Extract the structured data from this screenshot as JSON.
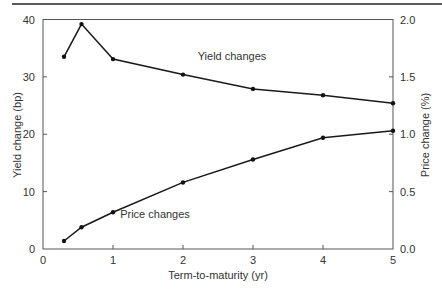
{
  "chart_data": {
    "type": "line",
    "title": "",
    "xlabel": "Term-to-maturity (yr)",
    "ylabel": "Yield change (bp)",
    "y2label": "Price change (%)",
    "xlim": [
      0,
      5
    ],
    "ylim": [
      0,
      40
    ],
    "y2lim": [
      0,
      2.0
    ],
    "xticks": [
      0,
      1,
      2,
      3,
      4,
      5
    ],
    "yticks": [
      0,
      10,
      20,
      30,
      40
    ],
    "y2ticks": [
      "0.0",
      "0.5",
      "1.0",
      "1.5",
      "2.0"
    ],
    "grid": false,
    "legend": "inline annotations",
    "series": [
      {
        "name": "Yield changes",
        "axis": "left",
        "x": [
          0.3,
          0.55,
          1,
          2,
          3,
          4,
          5
        ],
        "values": [
          33.5,
          39.2,
          33.1,
          30.4,
          27.9,
          26.8,
          25.4
        ]
      },
      {
        "name": "Price changes",
        "axis": "right",
        "x": [
          0.3,
          0.55,
          1,
          2,
          3,
          4,
          5
        ],
        "values": [
          0.07,
          0.19,
          0.32,
          0.58,
          0.78,
          0.97,
          1.03
        ]
      }
    ],
    "annotations": [
      {
        "text": "Yield changes",
        "x": 2.7,
        "y": 33
      },
      {
        "text": "Price changes",
        "x": 1.6,
        "y": 0.27
      }
    ]
  }
}
